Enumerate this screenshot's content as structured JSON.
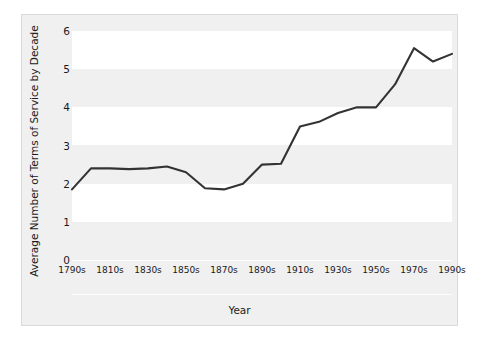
{
  "chart_data": {
    "type": "line",
    "title": "",
    "xlabel": "Year",
    "ylabel": "Average Number of Terms of Service by Decade",
    "categories": [
      "1790s",
      "1800s",
      "1810s",
      "1820s",
      "1830s",
      "1840s",
      "1850s",
      "1860s",
      "1870s",
      "1880s",
      "1890s",
      "1900s",
      "1910s",
      "1920s",
      "1930s",
      "1940s",
      "1950s",
      "1960s",
      "1970s",
      "1980s",
      "1990s"
    ],
    "xtick_labels": [
      "1790s",
      "1810s",
      "1830s",
      "1850s",
      "1870s",
      "1890s",
      "1910s",
      "1930s",
      "1950s",
      "1970s",
      "1990s"
    ],
    "ytick_labels": [
      "0",
      "1",
      "2",
      "3",
      "4",
      "5",
      "6"
    ],
    "values": [
      1.85,
      2.4,
      2.4,
      2.38,
      2.4,
      2.45,
      2.3,
      1.88,
      1.85,
      2.0,
      2.5,
      2.52,
      3.5,
      3.62,
      3.85,
      4.0,
      4.0,
      4.6,
      5.55,
      5.2,
      5.4
    ],
    "series": [
      {
        "name": "Average Number of Terms of Service by Decade",
        "values": [
          1.85,
          2.4,
          2.4,
          2.38,
          2.4,
          2.45,
          2.3,
          1.88,
          1.85,
          2.0,
          2.5,
          2.52,
          3.5,
          3.62,
          3.85,
          4.0,
          4.0,
          4.6,
          5.55,
          5.2,
          5.4
        ],
        "color": "#333333"
      }
    ],
    "ylim": [
      0,
      6
    ],
    "yticks": [
      0,
      1,
      2,
      3,
      4,
      5,
      6
    ],
    "grid": false,
    "banding": true,
    "legend": null,
    "line_color": "#333333",
    "band_color": "#ffffff",
    "background_color": "#f0f0f0"
  }
}
